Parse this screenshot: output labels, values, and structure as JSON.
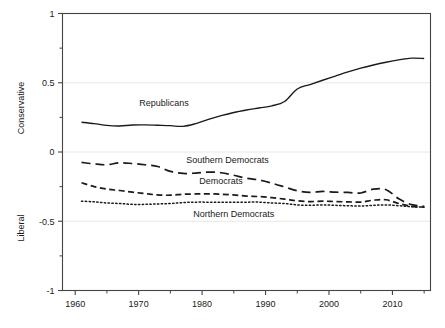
{
  "chart_data": {
    "type": "line",
    "title": "",
    "subtitle": "",
    "xlabel": "",
    "ylabel_top": "Conservative",
    "ylabel_bottom": "Liberal",
    "xlim": [
      1958,
      2016
    ],
    "ylim": [
      -1,
      1
    ],
    "grid": true,
    "grid_orientation": "horizontal",
    "legend_position": "inline-annotations",
    "x_ticks_major": [
      1960,
      1970,
      1980,
      1990,
      2000,
      2010
    ],
    "x_tick_labels": [
      "1960",
      "1970",
      "1980",
      "1990",
      "2000",
      "2010"
    ],
    "x_ticks_minor": [
      1965,
      1975,
      1985,
      1995,
      2005,
      2015
    ],
    "y_ticks_major": [
      1,
      0.5,
      0,
      -0.5,
      -1
    ],
    "y_tick_labels": [
      "1",
      "0.5",
      "0",
      "-0.5",
      "-1"
    ],
    "y_ticks_minor": [
      0.75,
      0.25,
      -0.25,
      -0.75
    ],
    "x": [
      1961,
      1963,
      1965,
      1967,
      1969,
      1971,
      1973,
      1975,
      1977,
      1979,
      1981,
      1983,
      1985,
      1987,
      1989,
      1991,
      1993,
      1995,
      1997,
      1999,
      2001,
      2003,
      2005,
      2007,
      2009,
      2011,
      2013,
      2015
    ],
    "series": [
      {
        "name": "Republicans",
        "linestyle": "solid",
        "color": "#1a1a1a",
        "values": [
          0.215,
          0.205,
          0.192,
          0.188,
          0.195,
          0.196,
          0.193,
          0.19,
          0.185,
          0.205,
          0.235,
          0.262,
          0.285,
          0.303,
          0.318,
          0.333,
          0.365,
          0.455,
          0.487,
          0.518,
          0.548,
          0.578,
          0.605,
          0.628,
          0.648,
          0.665,
          0.678,
          0.675
        ],
        "label_x": 1974,
        "label_y": 0.355
      },
      {
        "name": "Southern Democrats",
        "linestyle": "long-dash",
        "color": "#1a1a1a",
        "values": [
          -0.075,
          -0.086,
          -0.092,
          -0.078,
          -0.083,
          -0.092,
          -0.105,
          -0.14,
          -0.155,
          -0.152,
          -0.145,
          -0.15,
          -0.168,
          -0.19,
          -0.202,
          -0.225,
          -0.252,
          -0.28,
          -0.292,
          -0.285,
          -0.29,
          -0.292,
          -0.296,
          -0.268,
          -0.272,
          -0.338,
          -0.38,
          -0.392
        ],
        "label_x": 1984,
        "label_y": -0.055
      },
      {
        "name": "Democrats",
        "linestyle": "dash",
        "color": "#1a1a1a",
        "values": [
          -0.222,
          -0.25,
          -0.268,
          -0.278,
          -0.29,
          -0.3,
          -0.31,
          -0.312,
          -0.305,
          -0.303,
          -0.302,
          -0.305,
          -0.31,
          -0.318,
          -0.322,
          -0.33,
          -0.34,
          -0.352,
          -0.358,
          -0.355,
          -0.358,
          -0.36,
          -0.362,
          -0.348,
          -0.345,
          -0.372,
          -0.392,
          -0.398
        ],
        "label_x": 1983,
        "label_y": -0.205
      },
      {
        "name": "Northern Democrats",
        "linestyle": "dotted",
        "color": "#1a1a1a",
        "values": [
          -0.355,
          -0.36,
          -0.368,
          -0.372,
          -0.378,
          -0.378,
          -0.375,
          -0.372,
          -0.365,
          -0.362,
          -0.362,
          -0.362,
          -0.362,
          -0.362,
          -0.362,
          -0.368,
          -0.372,
          -0.382,
          -0.385,
          -0.382,
          -0.385,
          -0.388,
          -0.39,
          -0.385,
          -0.382,
          -0.388,
          -0.395,
          -0.398
        ],
        "label_x": 1985,
        "label_y": -0.445
      }
    ]
  },
  "axis": {
    "y_label_conservative": "Conservative",
    "y_label_liberal": "Liberal"
  },
  "colors": {
    "line": "#1a1a1a",
    "grid": "#e8e8e8",
    "frame": "#444444",
    "text": "#1a1a1a",
    "background": "#ffffff"
  }
}
